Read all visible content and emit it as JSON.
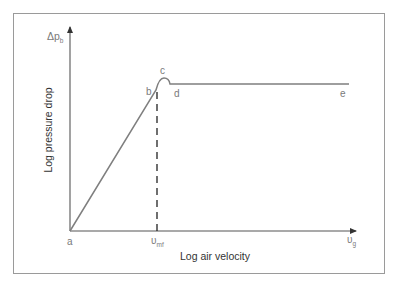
{
  "diagram": {
    "y_axis": {
      "title": "Log pressure drop",
      "symbol": "Δp",
      "symbol_sub": "b"
    },
    "x_axis": {
      "title": "Log air velocity",
      "mark_symbol": "υ",
      "mark_sub": "mf",
      "end_symbol": "υ",
      "end_sub": "g"
    },
    "points": {
      "a": "a",
      "b": "b",
      "c": "c",
      "d": "d",
      "e": "e"
    },
    "colors": {
      "curve": "#7f7f7f",
      "axes": "#555555",
      "frame": "#9a9a9a",
      "labels": "#7a7a7a",
      "titles": "#333333"
    }
  }
}
